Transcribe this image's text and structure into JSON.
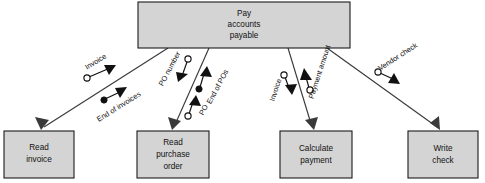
{
  "diagram": {
    "type": "structure-chart",
    "canvas": {
      "width": 485,
      "height": 183
    },
    "colors": {
      "box_fill": "#d4d4d4",
      "box_stroke": "#1a1a1a",
      "line": "#3a3a3a",
      "couple_fill_data": "#ffffff",
      "couple_fill_control": "#111111",
      "text": "#111111",
      "background": "#ffffff"
    },
    "modules": [
      {
        "id": "pay-accounts-payable",
        "label": "Pay accounts payable",
        "lines": [
          "Pay",
          "accounts",
          "payable"
        ],
        "level": "parent",
        "x": 138,
        "y": 2,
        "w": 212,
        "h": 46
      },
      {
        "id": "read-invoice",
        "label": "Read invoice",
        "lines": [
          "Read",
          "invoice"
        ],
        "level": "child",
        "x": 4,
        "y": 131,
        "w": 70,
        "h": 47
      },
      {
        "id": "read-purchase-order",
        "label": "Read purchase order",
        "lines": [
          "Read",
          "purchase",
          "order"
        ],
        "level": "child",
        "x": 137,
        "y": 131,
        "w": 72,
        "h": 47
      },
      {
        "id": "calculate-payment",
        "label": "Calculate payment",
        "lines": [
          "Calculate",
          "payment"
        ],
        "level": "child",
        "x": 280,
        "y": 131,
        "w": 72,
        "h": 47
      },
      {
        "id": "write-check",
        "label": "Write check",
        "lines": [
          "Write",
          "check"
        ],
        "level": "child",
        "x": 408,
        "y": 131,
        "w": 70,
        "h": 47
      }
    ],
    "connectors": [
      {
        "id": "conn-read-invoice",
        "from": "pay-accounts-payable",
        "to": "read-invoice",
        "x1": 168,
        "y1": 48,
        "x2": 41,
        "y2": 129
      },
      {
        "id": "conn-read-purchase-order",
        "from": "pay-accounts-payable",
        "to": "read-purchase-order",
        "x1": 209,
        "y1": 48,
        "x2": 173,
        "y2": 129
      },
      {
        "id": "conn-calculate-payment",
        "from": "pay-accounts-payable",
        "to": "calculate-payment",
        "x1": 288,
        "y1": 48,
        "x2": 313,
        "y2": 129
      },
      {
        "id": "conn-write-check",
        "from": "pay-accounts-payable",
        "to": "write-check",
        "x1": 327,
        "y1": 48,
        "x2": 440,
        "y2": 129
      }
    ],
    "couples": [
      {
        "id": "couple-invoice-up",
        "label": "Invoice",
        "kind": "data",
        "direction": "up",
        "connector": "conn-read-invoice",
        "label_x": 96,
        "label_y": 62,
        "label_rotate": 32,
        "tail_x": 89,
        "tail_y": 77,
        "head_x": 113,
        "head_y": 67
      },
      {
        "id": "couple-end-of-invoices-up",
        "label": "End of invoices",
        "kind": "control",
        "direction": "up",
        "connector": "conn-read-invoice",
        "label_x": 117,
        "label_y": 104,
        "label_rotate": 32,
        "tail_x": 105,
        "tail_y": 99,
        "head_x": 122,
        "head_y": 90
      },
      {
        "id": "couple-po-number-down",
        "label": "PO number",
        "kind": "data",
        "direction": "down",
        "connector": "conn-read-purchase-order",
        "label_x": 171,
        "label_y": 69,
        "label_rotate": -62,
        "tail_x": 187,
        "tail_y": 61,
        "head_x": 179,
        "head_y": 80
      },
      {
        "id": "couple-end-of-pos-up",
        "label": "End of POs",
        "kind": "control",
        "direction": "up",
        "connector": "conn-read-purchase-order",
        "label_x": 218,
        "label_y": 88,
        "label_rotate": -62,
        "tail_x": 200,
        "tail_y": 88,
        "head_x": 206,
        "head_y": 70
      },
      {
        "id": "couple-po-up",
        "label": "PO",
        "kind": "data",
        "direction": "up",
        "connector": "conn-read-purchase-order",
        "label_x": 203,
        "label_y": 110,
        "label_rotate": -62,
        "tail_x": 189,
        "tail_y": 116,
        "head_x": 195,
        "head_y": 99
      },
      {
        "id": "couple-invoice-down",
        "label": "Invoice",
        "kind": "data",
        "direction": "down",
        "connector": "conn-calculate-payment",
        "label_x": 277,
        "label_y": 89,
        "label_rotate": -72,
        "tail_x": 285,
        "tail_y": 75,
        "head_x": 291,
        "head_y": 92
      },
      {
        "id": "couple-payment-amount-up",
        "label": "Payment amount",
        "kind": "data",
        "direction": "up",
        "connector": "conn-calculate-payment",
        "label_x": 319,
        "label_y": 72,
        "label_rotate": -72,
        "tail_x": 309,
        "tail_y": 90,
        "head_x": 304,
        "head_y": 73
      },
      {
        "id": "couple-vendor-check-down",
        "label": "Vendor check",
        "kind": "data",
        "direction": "down",
        "connector": "conn-write-check",
        "label_x": 397,
        "label_y": 58,
        "label_rotate": 33,
        "tail_x": 379,
        "tail_y": 72,
        "head_x": 396,
        "head_y": 81
      }
    ]
  }
}
